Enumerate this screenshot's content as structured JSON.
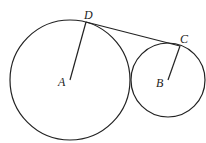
{
  "diagram": {
    "type": "geometry",
    "circles": [
      {
        "id": "A",
        "center": [
          70,
          80
        ],
        "radius": 60
      },
      {
        "id": "B",
        "center": [
          168,
          80
        ],
        "radius": 37
      }
    ],
    "points": {
      "A": {
        "label": "A",
        "pos": [
          70,
          80
        ],
        "label_pos": [
          61,
          86
        ]
      },
      "B": {
        "label": "B",
        "pos": [
          168,
          80
        ],
        "label_pos": [
          158,
          87
        ]
      },
      "C": {
        "label": "C",
        "pos": [
          180,
          46
        ],
        "label_pos": [
          180,
          43
        ]
      },
      "D": {
        "label": "D",
        "pos": [
          86,
          22
        ],
        "label_pos": [
          84,
          19
        ]
      }
    },
    "segments": [
      {
        "from": "A",
        "to": "D"
      },
      {
        "from": "B",
        "to": "C"
      },
      {
        "from": "D",
        "to": "C"
      }
    ],
    "labels": {
      "A": "A",
      "B": "B",
      "C": "C",
      "D": "D"
    },
    "colors": {
      "stroke": "#222222",
      "background": "#ffffff"
    }
  }
}
